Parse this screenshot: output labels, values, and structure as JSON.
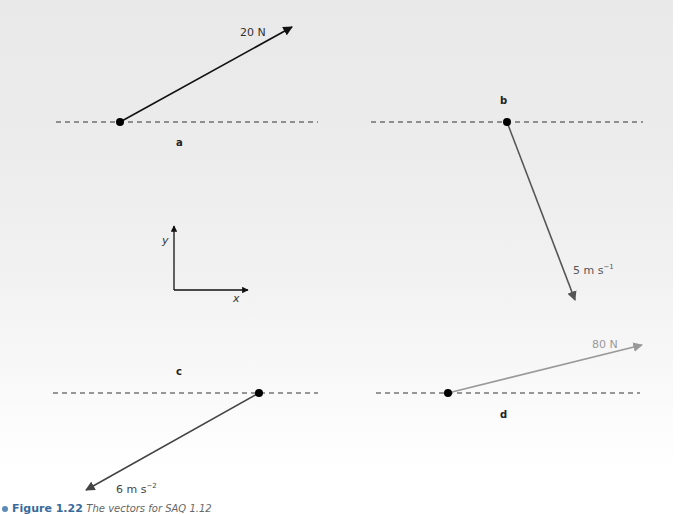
{
  "figure": {
    "number": "Figure 1.22",
    "caption": "The vectors for SAQ 1.12"
  },
  "panels": [
    {
      "id": "a",
      "label": "a",
      "vector_label": "20 N",
      "vector_color": "#111111",
      "description": "force of 20 N directed up and to the right at ~30° above horizontal"
    },
    {
      "id": "b",
      "label": "b",
      "vector_label": "5 m s",
      "vector_exponent": "−1",
      "vector_color": "#555555",
      "description": "velocity of 5 m/s directed steeply downward and slightly to the right"
    },
    {
      "id": "c",
      "label": "c",
      "vector_label": "6 m s",
      "vector_exponent": "−2",
      "vector_color": "#444444",
      "description": "acceleration of 6 m/s² directed down and to the left at ~30° below horizontal"
    },
    {
      "id": "d",
      "label": "d",
      "vector_label": "80 N",
      "vector_color": "#999999",
      "description": "force of 80 N directed up and to the right at ~15° above horizontal"
    }
  ],
  "axes_key": {
    "x_label": "x",
    "y_label": "y"
  }
}
